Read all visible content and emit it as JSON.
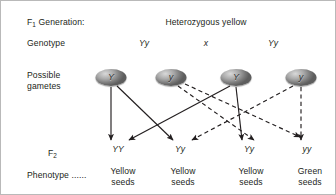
{
  "diagram": {
    "title_row": {
      "left_label": "F1 Generation:",
      "left_label_main": "F",
      "left_label_sub": "1",
      "left_label_rest": " Generation:",
      "center_label": "Heterozygous yellow"
    },
    "rows": {
      "genotype_label": "Genotype",
      "gametes_label_line1": "Possible",
      "gametes_label_line2": "gametes",
      "f2_label_main": "F",
      "f2_label_sub": "2",
      "phenotype_label": "Phenotype ......"
    },
    "parent_genotypes": [
      {
        "name": "parent-left",
        "text": "Yy",
        "x": 143
      },
      {
        "name": "cross-symbol",
        "text": "x",
        "x": 205
      },
      {
        "name": "parent-right",
        "text": "Yy",
        "x": 272
      }
    ],
    "gametes": [
      {
        "name": "gamete-1",
        "allele": "Y",
        "x": 110,
        "y": 68,
        "type": "dominant"
      },
      {
        "name": "gamete-2",
        "allele": "y",
        "x": 170,
        "y": 68,
        "type": "recessive"
      },
      {
        "name": "gamete-3",
        "allele": "Y",
        "x": 235,
        "y": 68,
        "type": "dominant"
      },
      {
        "name": "gamete-4",
        "allele": "y",
        "x": 300,
        "y": 68,
        "type": "recessive"
      }
    ],
    "f2_genotypes": [
      {
        "name": "f2-genotype-1",
        "text": "YY",
        "x": 117
      },
      {
        "name": "f2-genotype-2",
        "text": "Yy",
        "x": 176
      },
      {
        "name": "f2-genotype-3",
        "text": "Yy",
        "x": 247
      },
      {
        "name": "f2-genotype-4",
        "text": "yy",
        "x": 305
      }
    ],
    "phenotypes": [
      {
        "name": "phenotype-1",
        "line1": "Yellow",
        "line2": "seeds",
        "x": 122
      },
      {
        "name": "phenotype-2",
        "line1": "Yellow",
        "line2": "seeds",
        "x": 182
      },
      {
        "name": "phenotype-3",
        "line1": "Yellow",
        "line2": "seeds",
        "x": 250
      },
      {
        "name": "phenotype-4",
        "line1": "Green",
        "line2": "seeds",
        "x": 309
      }
    ],
    "arrows": [
      {
        "name": "arrow-gamete1-to-YY",
        "from": "gamete-1",
        "to": "f2-genotype-1",
        "style": "solid",
        "x1": 110,
        "y1": 86,
        "x2": 110,
        "y2": 139
      },
      {
        "name": "arrow-gamete1-to-Yy2",
        "from": "gamete-1",
        "to": "f2-genotype-2",
        "style": "solid",
        "x1": 116,
        "y1": 85,
        "x2": 172,
        "y2": 139
      },
      {
        "name": "arrow-gamete3-to-YY",
        "from": "gamete-3",
        "to": "f2-genotype-1",
        "style": "solid",
        "x1": 229,
        "y1": 85,
        "x2": 126,
        "y2": 139
      },
      {
        "name": "arrow-gamete3-to-Yy3",
        "from": "gamete-3",
        "to": "f2-genotype-3",
        "style": "solid",
        "x1": 235,
        "y1": 86,
        "x2": 241,
        "y2": 139
      },
      {
        "name": "arrow-gamete2-to-Yy2",
        "from": "gamete-2",
        "to": "f2-genotype-2",
        "style": "dashed",
        "x1": 177,
        "y1": 85,
        "x2": 254,
        "y2": 139
      },
      {
        "name": "arrow-gamete2-to-Yy3",
        "from": "gamete-2",
        "to": "f2-genotype-3",
        "style": "dashed",
        "x1": 183,
        "y1": 82,
        "x2": 300,
        "y2": 136
      },
      {
        "name": "arrow-gamete4-to-Yy3",
        "from": "gamete-4",
        "to": "f2-genotype-3",
        "style": "dashed",
        "x1": 292,
        "y1": 85,
        "x2": 189,
        "y2": 139
      },
      {
        "name": "arrow-gamete4-to-yy",
        "from": "gamete-4",
        "to": "f2-genotype-4",
        "style": "dashed",
        "x1": 300,
        "y1": 86,
        "x2": 300,
        "y2": 139
      }
    ],
    "colors": {
      "line": "#231f20",
      "text": "#231f20",
      "border": "#b9b9b9",
      "gamete_fill": "#9a9a9a"
    }
  }
}
